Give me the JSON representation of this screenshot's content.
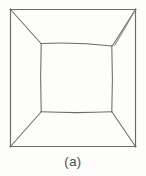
{
  "figure": {
    "caption": "(a)",
    "colors": {
      "background": "#fdfdfb",
      "stroke": "#6b6b6b",
      "stroke_light": "#8a8a8a",
      "caption_text": "#4a4a4a"
    },
    "geometry": {
      "outer_square": {
        "top_left": [
          10,
          9
        ],
        "top_right": [
          136,
          9
        ],
        "bottom_right": [
          136,
          147
        ],
        "bottom_left": [
          10,
          147
        ]
      },
      "inner_square": {
        "top_left": [
          41,
          43
        ],
        "top_right": [
          112,
          46
        ],
        "bottom_right": [
          112,
          112
        ],
        "bottom_left": [
          41,
          112
        ]
      },
      "diagonals": [
        {
          "name": "top-left-diagonal",
          "from": [
            10,
            9
          ],
          "to": [
            41,
            43
          ],
          "doubled": false
        },
        {
          "name": "top-right-diagonal",
          "from": [
            136,
            9
          ],
          "to": [
            112,
            46
          ],
          "doubled": true
        },
        {
          "name": "bottom-right-diagonal",
          "from": [
            136,
            147
          ],
          "to": [
            112,
            112
          ],
          "doubled": false
        },
        {
          "name": "bottom-left-diagonal",
          "from": [
            10,
            147
          ],
          "to": [
            41,
            112
          ],
          "doubled": false
        }
      ]
    }
  }
}
